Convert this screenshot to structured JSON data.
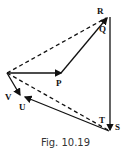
{
  "figure": {
    "caption": "Fig. 10.19",
    "labels": {
      "P": "P",
      "Q": "Q",
      "R": "R",
      "S": "S",
      "T": "T",
      "U": "U",
      "V": "V"
    },
    "vectors": [
      {
        "from": "O",
        "to": "P",
        "style": "solid"
      },
      {
        "from": "P",
        "to": "R",
        "style": "solid"
      },
      {
        "from": "O",
        "to": "R",
        "style": "dashed"
      },
      {
        "from": "R",
        "to": "S",
        "style": "solid"
      },
      {
        "from": "O",
        "to": "S",
        "style": "dashed"
      },
      {
        "from": "S",
        "to": "U",
        "style": "solid"
      },
      {
        "from": "O",
        "to": "V",
        "style": "solid"
      }
    ]
  }
}
